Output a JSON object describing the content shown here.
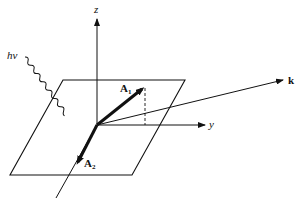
{
  "diagram": {
    "type": "3d-vector-geometry",
    "colors": {
      "background": "#ffffff",
      "ink": "#111111"
    },
    "labels": {
      "z_axis": "z",
      "y_axis": "y",
      "wave_vector": "k",
      "photon": "hν",
      "vector_1": "A",
      "vector_1_sub": "1",
      "vector_2": "A",
      "vector_2_sub": "2"
    },
    "elements": [
      {
        "name": "z-axis",
        "kind": "arrow",
        "from": [
          97,
          125
        ],
        "to": [
          97,
          18
        ]
      },
      {
        "name": "y-axis",
        "kind": "arrow",
        "from": [
          97,
          125
        ],
        "to": [
          206,
          125
        ]
      },
      {
        "name": "k-vector",
        "kind": "arrow",
        "from": [
          97,
          125
        ],
        "to": [
          284,
          80
        ]
      },
      {
        "name": "A1-vector",
        "kind": "thick-arrow",
        "from": [
          97,
          125
        ],
        "to": [
          145,
          86
        ]
      },
      {
        "name": "A2-vector",
        "kind": "thick-arrow",
        "from": [
          97,
          125
        ],
        "to": [
          76,
          166
        ]
      },
      {
        "name": "plane",
        "kind": "parallelogram",
        "points": [
          [
            63,
            80
          ],
          [
            185,
            80
          ],
          [
            132,
            175
          ],
          [
            10,
            175
          ]
        ]
      },
      {
        "name": "x-axis-line",
        "kind": "line",
        "from": [
          97,
          125
        ],
        "to": [
          56,
          198
        ]
      },
      {
        "name": "projection-dashed",
        "kind": "dashed-line",
        "from": [
          145,
          87
        ],
        "to": [
          145,
          125
        ]
      },
      {
        "name": "photon-wave",
        "kind": "wavy-line",
        "from": [
          25,
          57
        ],
        "to": [
          97,
          125
        ]
      }
    ]
  }
}
